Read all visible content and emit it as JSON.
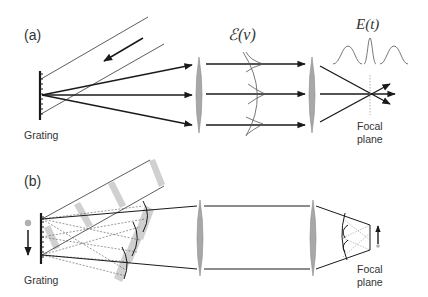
{
  "panel_a": {
    "label": "(a)",
    "grating_label": "Grating",
    "spectrum_label": "ℰ(ν)",
    "time_label": "E(t)",
    "focal_label_line1": "Focal",
    "focal_label_line2": "plane"
  },
  "panel_b": {
    "label": "(b)",
    "grating_label": "Grating",
    "focal_label_line1": "Focal",
    "focal_label_line2": "plane"
  },
  "colors": {
    "line": "#1a1a1a",
    "lens_fill": "#a8a8a8",
    "lens_stroke": "#888888",
    "beam_band": "#d0d0d0",
    "dot": "#b0b0b0",
    "curve": "#555555"
  }
}
